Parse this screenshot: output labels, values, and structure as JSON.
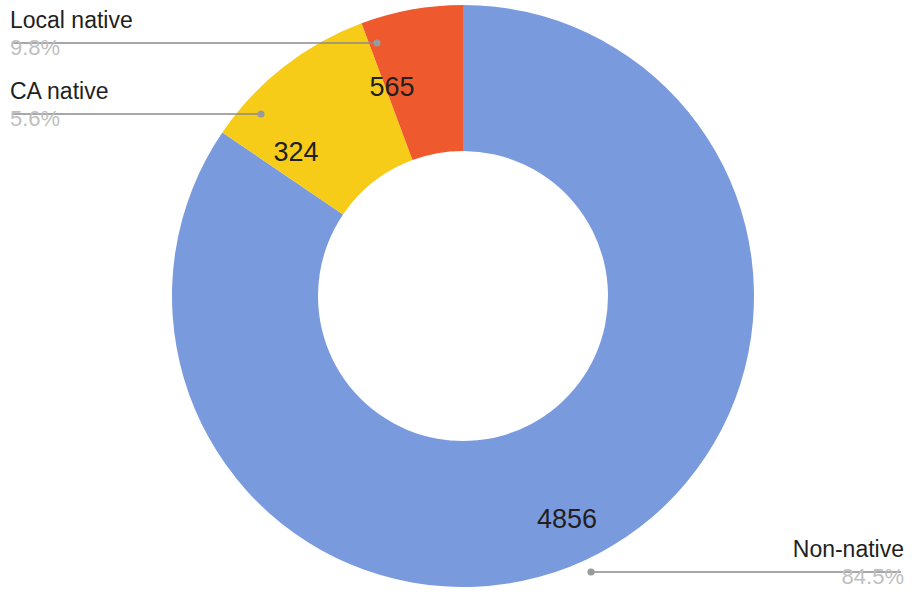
{
  "chart_data": {
    "type": "pie",
    "variant": "donut",
    "title": "",
    "subtitle": "",
    "xlabel": "",
    "ylabel": "",
    "legend_position": "callout-labels",
    "grid": false,
    "total": 5745,
    "value_label_format": "count",
    "outside_label_format": "name + percent",
    "start_angle_deg": 0,
    "direction": "clockwise",
    "categories": [
      "Non-native",
      "Local native",
      "CA native"
    ],
    "values": [
      4856,
      565,
      324
    ],
    "percents": [
      "84.5%",
      "9.8%",
      "5.6%"
    ],
    "percent_numbers": [
      84.5,
      9.8,
      5.6
    ],
    "colors": [
      "#7a9ade",
      "#f6cc19",
      "#ee5a2e"
    ],
    "slices": [
      {
        "name": "Non-native",
        "value": 4856,
        "value_label": "4856",
        "percent": 84.5,
        "percent_label": "84.5%",
        "color": "#7a9ade",
        "start_angle_deg": 0,
        "sweep_deg": 304.2
      },
      {
        "name": "Local native",
        "value": 565,
        "value_label": "565",
        "percent": 9.8,
        "percent_label": "9.8%",
        "color": "#f6cc19",
        "start_angle_deg": 304.2,
        "sweep_deg": 35.4
      },
      {
        "name": "CA native",
        "value": 324,
        "value_label": "324",
        "percent": 5.6,
        "percent_label": "5.6%",
        "color": "#ee5a2e",
        "start_angle_deg": 339.6,
        "sweep_deg": 20.4
      }
    ]
  },
  "callouts": {
    "local_native": {
      "name": "Local native",
      "percent": "9.8%"
    },
    "ca_native": {
      "name": "CA native",
      "percent": "5.6%"
    },
    "non_native": {
      "name": "Non-native",
      "percent": "84.5%"
    }
  },
  "slice_values": {
    "local_native": "565",
    "ca_native": "324",
    "non_native": "4856"
  },
  "style": {
    "background": "#ffffff",
    "leader_line_color": "#8a8a8a",
    "label_text_color": "#231f20",
    "percent_text_color": "#bfbfbf"
  }
}
